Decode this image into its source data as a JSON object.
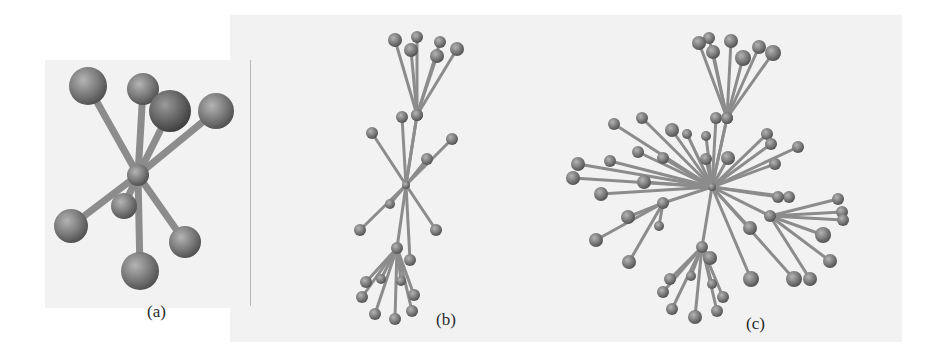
{
  "figure": {
    "panels": [
      {
        "id": "a",
        "label": "(a)",
        "label_pos": [
          147,
          302
        ],
        "hub": [
          138,
          175
        ],
        "hub_r": 11,
        "stroke_w": 7,
        "nodes": [
          {
            "x": 88,
            "y": 86,
            "r": 19,
            "parent": "hub"
          },
          {
            "x": 143,
            "y": 89,
            "r": 16,
            "parent": "hub"
          },
          {
            "x": 170,
            "y": 111,
            "r": 21,
            "parent": "hub",
            "dark": true
          },
          {
            "x": 216,
            "y": 111,
            "r": 18,
            "parent": "hub"
          },
          {
            "x": 71,
            "y": 226,
            "r": 17,
            "parent": "hub"
          },
          {
            "x": 124,
            "y": 206,
            "r": 13,
            "parent": "hub"
          },
          {
            "x": 185,
            "y": 242,
            "r": 16,
            "parent": "hub"
          },
          {
            "x": 140,
            "y": 271,
            "r": 19,
            "parent": "hub"
          }
        ]
      },
      {
        "id": "b",
        "label": "(b)",
        "label_pos": [
          436,
          310
        ],
        "hub": [
          406,
          185
        ],
        "hub_r": 4,
        "stroke_w": 3,
        "subhubs": [
          {
            "id": "t",
            "x": 417,
            "y": 115,
            "r": 6
          },
          {
            "id": "btm",
            "x": 397,
            "y": 248,
            "r": 6
          }
        ],
        "nodes": [
          {
            "x": 395,
            "y": 40,
            "r": 7,
            "parent": "t"
          },
          {
            "x": 417,
            "y": 37,
            "r": 6,
            "parent": "t"
          },
          {
            "x": 411,
            "y": 50,
            "r": 7,
            "parent": "t"
          },
          {
            "x": 440,
            "y": 42,
            "r": 6,
            "parent": "t"
          },
          {
            "x": 437,
            "y": 56,
            "r": 7,
            "parent": "t"
          },
          {
            "x": 457,
            "y": 49,
            "r": 7,
            "parent": "t"
          },
          {
            "x": 402,
            "y": 117,
            "r": 6,
            "parent": "hub"
          },
          {
            "x": 417,
            "y": 115,
            "r": 6,
            "parent": "hub"
          },
          {
            "x": 372,
            "y": 133,
            "r": 6,
            "parent": "hub"
          },
          {
            "x": 452,
            "y": 139,
            "r": 6,
            "parent": "hub"
          },
          {
            "x": 427,
            "y": 159,
            "r": 6,
            "parent": "hub"
          },
          {
            "x": 390,
            "y": 204,
            "r": 5,
            "parent": "hub"
          },
          {
            "x": 360,
            "y": 230,
            "r": 6,
            "parent": "hub"
          },
          {
            "x": 436,
            "y": 230,
            "r": 6,
            "parent": "hub"
          },
          {
            "x": 410,
            "y": 260,
            "r": 6,
            "parent": "hub"
          },
          {
            "x": 366,
            "y": 282,
            "r": 6,
            "parent": "btm"
          },
          {
            "x": 381,
            "y": 279,
            "r": 5,
            "parent": "btm"
          },
          {
            "x": 362,
            "y": 297,
            "r": 6,
            "parent": "btm"
          },
          {
            "x": 401,
            "y": 281,
            "r": 5,
            "parent": "btm"
          },
          {
            "x": 414,
            "y": 295,
            "r": 6,
            "parent": "btm"
          },
          {
            "x": 375,
            "y": 314,
            "r": 6,
            "parent": "btm"
          },
          {
            "x": 395,
            "y": 319,
            "r": 6,
            "parent": "btm"
          },
          {
            "x": 412,
            "y": 311,
            "r": 6,
            "parent": "btm"
          }
        ]
      },
      {
        "id": "c",
        "label": "(c)",
        "label_pos": [
          746,
          314
        ],
        "hub": [
          712,
          187
        ],
        "hub_r": 4,
        "stroke_w": 3,
        "subhubs": [
          {
            "id": "t",
            "x": 727,
            "y": 118,
            "r": 6
          },
          {
            "id": "bl",
            "x": 663,
            "y": 203,
            "r": 6
          },
          {
            "id": "br",
            "x": 770,
            "y": 216,
            "r": 6
          },
          {
            "id": "btm",
            "x": 702,
            "y": 247,
            "r": 6
          }
        ],
        "nodes": [
          {
            "x": 699,
            "y": 43,
            "r": 7,
            "parent": "t"
          },
          {
            "x": 709,
            "y": 38,
            "r": 6,
            "parent": "t"
          },
          {
            "x": 713,
            "y": 52,
            "r": 7,
            "parent": "t"
          },
          {
            "x": 731,
            "y": 41,
            "r": 7,
            "parent": "t"
          },
          {
            "x": 743,
            "y": 58,
            "r": 8,
            "parent": "t"
          },
          {
            "x": 759,
            "y": 47,
            "r": 7,
            "parent": "t"
          },
          {
            "x": 773,
            "y": 53,
            "r": 8,
            "parent": "t"
          },
          {
            "x": 716,
            "y": 118,
            "r": 6,
            "parent": "hub"
          },
          {
            "x": 727,
            "y": 118,
            "r": 6,
            "parent": "hub"
          },
          {
            "x": 614,
            "y": 124,
            "r": 6,
            "parent": "hub"
          },
          {
            "x": 642,
            "y": 118,
            "r": 6,
            "parent": "hub"
          },
          {
            "x": 672,
            "y": 130,
            "r": 7,
            "parent": "hub"
          },
          {
            "x": 687,
            "y": 134,
            "r": 5,
            "parent": "hub"
          },
          {
            "x": 706,
            "y": 136,
            "r": 5,
            "parent": "hub"
          },
          {
            "x": 610,
            "y": 161,
            "r": 6,
            "parent": "hub"
          },
          {
            "x": 638,
            "y": 152,
            "r": 6,
            "parent": "hub"
          },
          {
            "x": 663,
            "y": 158,
            "r": 6,
            "parent": "hub"
          },
          {
            "x": 706,
            "y": 159,
            "r": 6,
            "parent": "hub"
          },
          {
            "x": 728,
            "y": 158,
            "r": 7,
            "parent": "hub"
          },
          {
            "x": 767,
            "y": 134,
            "r": 6,
            "parent": "hub"
          },
          {
            "x": 771,
            "y": 144,
            "r": 6,
            "parent": "hub"
          },
          {
            "x": 798,
            "y": 147,
            "r": 6,
            "parent": "hub"
          },
          {
            "x": 578,
            "y": 164,
            "r": 7,
            "parent": "hub"
          },
          {
            "x": 573,
            "y": 178,
            "r": 7,
            "parent": "hub"
          },
          {
            "x": 644,
            "y": 182,
            "r": 7,
            "parent": "hub"
          },
          {
            "x": 601,
            "y": 194,
            "r": 7,
            "parent": "hub"
          },
          {
            "x": 775,
            "y": 164,
            "r": 6,
            "parent": "hub"
          },
          {
            "x": 789,
            "y": 197,
            "r": 6,
            "parent": "hub"
          },
          {
            "x": 778,
            "y": 197,
            "r": 6,
            "parent": "hub"
          },
          {
            "x": 628,
            "y": 217,
            "r": 7,
            "parent": "bl"
          },
          {
            "x": 596,
            "y": 240,
            "r": 7,
            "parent": "bl"
          },
          {
            "x": 659,
            "y": 226,
            "r": 5,
            "parent": "bl"
          },
          {
            "x": 629,
            "y": 262,
            "r": 7,
            "parent": "bl"
          },
          {
            "x": 838,
            "y": 199,
            "r": 6,
            "parent": "br"
          },
          {
            "x": 842,
            "y": 212,
            "r": 6,
            "parent": "br"
          },
          {
            "x": 843,
            "y": 220,
            "r": 6,
            "parent": "br"
          },
          {
            "x": 823,
            "y": 235,
            "r": 8,
            "parent": "br"
          },
          {
            "x": 830,
            "y": 261,
            "r": 7,
            "parent": "br"
          },
          {
            "x": 810,
            "y": 279,
            "r": 7,
            "parent": "br"
          },
          {
            "x": 750,
            "y": 228,
            "r": 7,
            "parent": "hub"
          },
          {
            "x": 751,
            "y": 279,
            "r": 8,
            "parent": "hub"
          },
          {
            "x": 794,
            "y": 279,
            "r": 8,
            "parent": "hub"
          },
          {
            "x": 710,
            "y": 258,
            "r": 7,
            "parent": "btm"
          },
          {
            "x": 670,
            "y": 279,
            "r": 6,
            "parent": "btm"
          },
          {
            "x": 663,
            "y": 292,
            "r": 6,
            "parent": "btm"
          },
          {
            "x": 691,
            "y": 276,
            "r": 5,
            "parent": "btm"
          },
          {
            "x": 712,
            "y": 284,
            "r": 5,
            "parent": "btm"
          },
          {
            "x": 723,
            "y": 297,
            "r": 6,
            "parent": "btm"
          },
          {
            "x": 672,
            "y": 309,
            "r": 6,
            "parent": "btm"
          },
          {
            "x": 695,
            "y": 317,
            "r": 7,
            "parent": "btm"
          },
          {
            "x": 717,
            "y": 311,
            "r": 6,
            "parent": "btm"
          }
        ]
      }
    ]
  },
  "colors": {
    "panel_bg": "#f2f2f2",
    "stick": "#8c8c8c",
    "ball": "#7a7a7a",
    "ball_highlight": "#b0b0b0",
    "ball_shadow": "#4a4a4a"
  }
}
